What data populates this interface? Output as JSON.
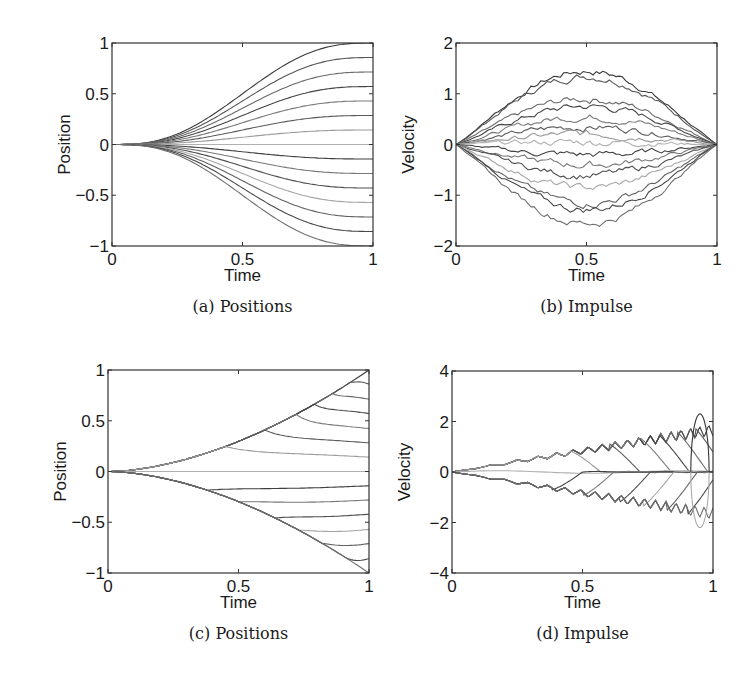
{
  "chart_data": [
    {
      "id": "a",
      "type": "line",
      "caption": "(a) Positions",
      "title": "",
      "xlabel": "Time",
      "ylabel": "Position",
      "xlim": [
        0,
        1
      ],
      "ylim": [
        -1,
        1
      ],
      "xticks": [
        "0",
        "0.5",
        "1"
      ],
      "yticks": [
        "-1",
        "-0.5",
        "0",
        "0.5",
        "1"
      ],
      "grid": false,
      "legend": null,
      "description": "15 smooth S-shaped trajectories starting at 0 and ending at evenly spaced final positions",
      "series_final_values": [
        1.0,
        0.857,
        0.714,
        0.571,
        0.429,
        0.286,
        0.143,
        0.0,
        -0.143,
        -0.286,
        -0.429,
        -0.571,
        -0.714,
        -0.857,
        -1.0
      ]
    },
    {
      "id": "b",
      "type": "line",
      "caption": "(b) Impulse",
      "title": "",
      "xlabel": "Time",
      "ylabel": "Velocity",
      "xlim": [
        0,
        1
      ],
      "ylim": [
        -2,
        2
      ],
      "xticks": [
        "0",
        "0.5",
        "1"
      ],
      "yticks": [
        "-2",
        "-1",
        "0",
        "1",
        "2"
      ],
      "grid": false,
      "legend": null,
      "description": "15 noisy bell-shaped velocity profiles starting and ending at 0",
      "series_peak_values": [
        1.45,
        1.35,
        0.9,
        0.75,
        0.55,
        0.35,
        0.2,
        0.05,
        -0.2,
        -0.4,
        -0.6,
        -0.85,
        -1.15,
        -1.28,
        -1.55
      ]
    },
    {
      "id": "c",
      "type": "line",
      "caption": "(c) Positions",
      "title": "",
      "xlabel": "Time",
      "ylabel": "Position",
      "xlim": [
        0,
        1
      ],
      "ylim": [
        -1,
        1
      ],
      "xticks": [
        "0",
        "0.5",
        "1"
      ],
      "yticks": [
        "-1",
        "-0.5",
        "0",
        "0.5",
        "1"
      ],
      "grid": false,
      "legend": null,
      "description": "Trajectories follow an upper and lower envelope (±t^1.5-like) then branch off to flat final positions",
      "series_final_values": [
        1.0,
        0.86,
        0.71,
        0.57,
        0.42,
        0.28,
        0.14,
        0.0,
        -0.14,
        -0.28,
        -0.42,
        -0.57,
        -0.71,
        -0.86,
        -1.0
      ],
      "branch_times": [
        1.0,
        0.93,
        0.86,
        0.79,
        0.72,
        0.6,
        0.45,
        0.0,
        0.38,
        0.5,
        0.64,
        0.73,
        0.82,
        0.9,
        1.0
      ]
    },
    {
      "id": "d",
      "type": "line",
      "caption": "(d) Impulse",
      "title": "",
      "xlabel": "Time",
      "ylabel": "Velocity",
      "xlim": [
        0,
        1
      ],
      "ylim": [
        -4,
        4
      ],
      "xticks": [
        "0",
        "0.5",
        "1"
      ],
      "yticks": [
        "-4",
        "-2",
        "0",
        "2",
        "4"
      ],
      "grid": false,
      "legend": null,
      "description": "Zig-zag velocity profiles growing linearly in envelope, each dropping back toward 0 at its branch time; max near +2.3 / -2.2 at t≈0.95",
      "envelope_peak": [
        2.3,
        -2.2
      ]
    }
  ]
}
